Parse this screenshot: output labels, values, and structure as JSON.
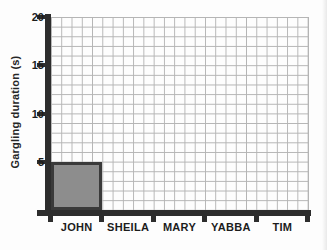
{
  "chart_data": {
    "type": "bar",
    "title": "",
    "xlabel": "",
    "ylabel": "Gargling duration (s)",
    "categories": [
      "JOHN",
      "SHEILA",
      "MARY",
      "YABBA",
      "TIM"
    ],
    "values": [
      5,
      0,
      0,
      0,
      0
    ],
    "ylim": [
      0,
      20
    ],
    "ytick_values": [
      5,
      10,
      15,
      20
    ],
    "ytick_labels": [
      "5",
      "10",
      "15",
      "20"
    ],
    "grid": "minor gridlines every 1 y-unit and every 1/5 of a category width; no major emphasis",
    "legend": "none",
    "bars_drawn": [
      "JOHN"
    ],
    "colors": {
      "bar_fill": "#8d8d8d",
      "bar_border": "#3a3a3a",
      "axis": "#2d2d2d",
      "grid_line": "#b4b4b4",
      "text": "#1c1c1c",
      "background": "#fdfdfd"
    }
  }
}
